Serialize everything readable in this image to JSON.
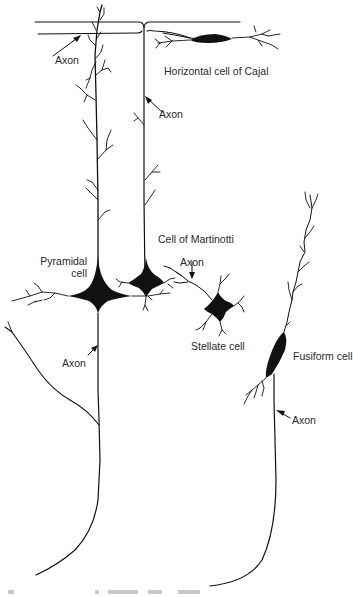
{
  "figure": {
    "type": "neuron-morphology-illustration",
    "style": "black ink line drawing on white",
    "colors": {
      "ink": "#111111",
      "background": "#ffffff",
      "label_text": "#2a2a2a"
    }
  },
  "labels": {
    "axon_top_left": "Axon",
    "horizontal_cell": "Horizontal cell of Cajal",
    "axon_martinotti": "Axon",
    "martinotti_cell": "Cell of Martinotti",
    "pyramidal_line1": "Pyramidal",
    "pyramidal_line2": "cell",
    "axon_stellate": "Axon",
    "stellate_cell": "Stellate cell",
    "fusiform_cell": "Fusiform cell",
    "axon_pyramidal": "Axon",
    "axon_fusiform": "Axon"
  },
  "cells": [
    {
      "name": "Horizontal cell of Cajal",
      "soma_shape": "elongated horizontal spindle",
      "position": "top right, beneath surface lines"
    },
    {
      "name": "Pyramidal cell",
      "soma_shape": "large triangular",
      "position": "left center",
      "has_apical_dendrite": true
    },
    {
      "name": "Cell of Martinotti",
      "soma_shape": "small star",
      "position": "center",
      "axon_direction": "ascending to surface"
    },
    {
      "name": "Stellate cell",
      "soma_shape": "star",
      "position": "center right"
    },
    {
      "name": "Fusiform cell",
      "soma_shape": "spindle",
      "position": "right",
      "axon_direction": "descending"
    }
  ],
  "caption": {
    "visible": false,
    "note": "cut off at bottom edge, illegible"
  }
}
